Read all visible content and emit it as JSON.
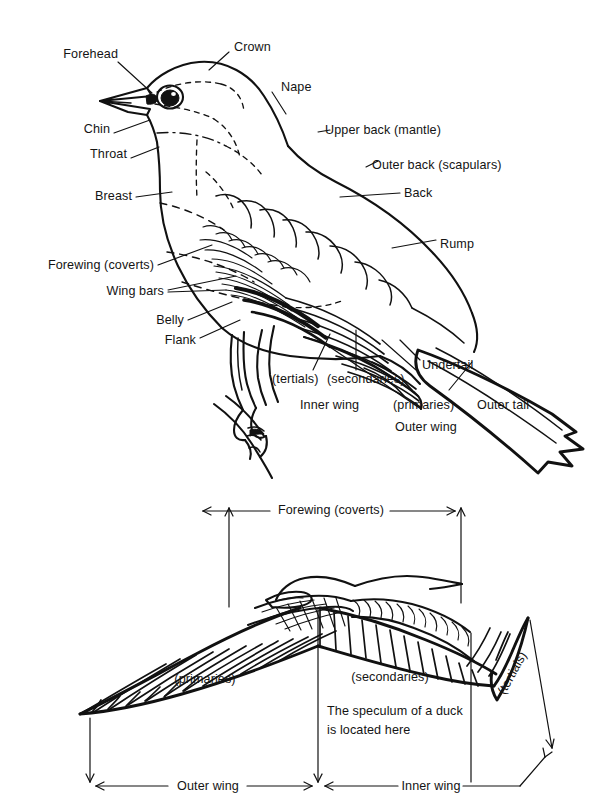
{
  "figure": {
    "ink_color": "#111111",
    "background_color": "#ffffff"
  },
  "upper_diagram": {
    "name": "perched-bird-topography",
    "labels": [
      {
        "id": "forehead",
        "text": "Forehead"
      },
      {
        "id": "crown",
        "text": "Crown"
      },
      {
        "id": "nape",
        "text": "Nape"
      },
      {
        "id": "chin",
        "text": "Chin"
      },
      {
        "id": "throat",
        "text": "Throat"
      },
      {
        "id": "upper-back",
        "text": "Upper back (mantle)"
      },
      {
        "id": "outer-back",
        "text": "Outer back (scapulars)"
      },
      {
        "id": "breast",
        "text": "Breast"
      },
      {
        "id": "back",
        "text": "Back"
      },
      {
        "id": "rump",
        "text": "Rump"
      },
      {
        "id": "forewing",
        "text": "Forewing (coverts)"
      },
      {
        "id": "wing-bars",
        "text": "Wing bars"
      },
      {
        "id": "belly",
        "text": "Belly"
      },
      {
        "id": "flank",
        "text": "Flank"
      },
      {
        "id": "tertials",
        "text": "(tertials)"
      },
      {
        "id": "secondaries",
        "text": "(secondaries)"
      },
      {
        "id": "inner-wing",
        "text": "Inner wing"
      },
      {
        "id": "primaries",
        "text": "(primaries)"
      },
      {
        "id": "outer-wing",
        "text": "Outer wing"
      },
      {
        "id": "undertail",
        "text": "Undertail"
      },
      {
        "id": "outer-tail",
        "text": "Outer tall"
      }
    ]
  },
  "lower_diagram": {
    "name": "spread-wing-topography",
    "labels": [
      {
        "id": "forewing-coverts",
        "text": "Forewing (coverts)"
      },
      {
        "id": "primaries",
        "text": "(primaries)"
      },
      {
        "id": "secondaries",
        "text": "(secondaries)"
      },
      {
        "id": "tertials",
        "text": "(tertials)"
      },
      {
        "id": "outer-wing",
        "text": "Outer wing"
      },
      {
        "id": "inner-wing",
        "text": "Inner wing"
      }
    ],
    "note": {
      "line1": "The speculum of a duck",
      "line2": "is located here"
    }
  }
}
